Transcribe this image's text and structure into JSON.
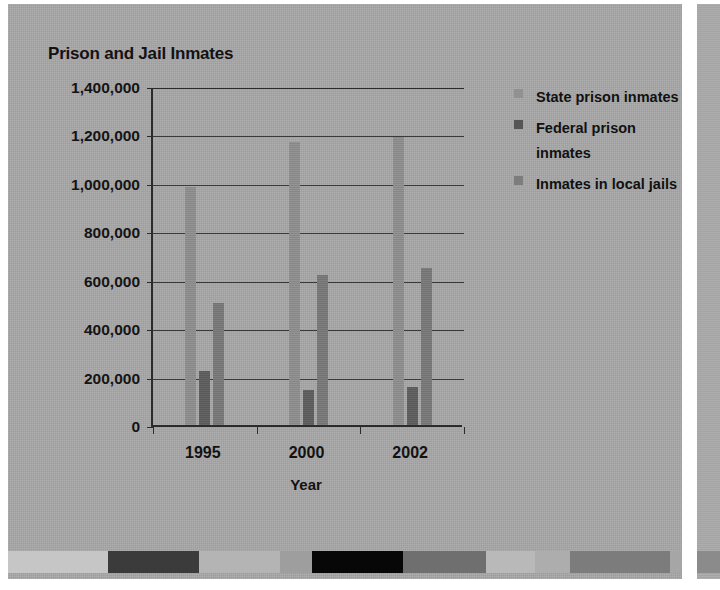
{
  "chart_data": {
    "type": "bar",
    "title": "Prison and Jail Inmates",
    "xlabel": "Year",
    "ylabel": "",
    "categories": [
      "1995",
      "2000",
      "2002"
    ],
    "series": [
      {
        "name": "State prison inmates",
        "key": "state",
        "color": "#8e8e8e",
        "values": [
          985000,
          1170000,
          1190000
        ]
      },
      {
        "name": "Federal prison inmates",
        "key": "federal",
        "color": "#5e5e5e",
        "values": [
          225000,
          145000,
          155000
        ]
      },
      {
        "name": "Inmates in local jails",
        "key": "local",
        "color": "#787878",
        "values": [
          505000,
          620000,
          650000
        ]
      }
    ],
    "ylim": [
      0,
      1400000
    ],
    "ytick_values": [
      0,
      200000,
      400000,
      600000,
      800000,
      1000000,
      1200000,
      1400000
    ],
    "ytick_labels": [
      "0",
      "200,000",
      "400,000",
      "600,000",
      "800,000",
      "1,000,000",
      "1,200,000",
      "1,400,000"
    ],
    "grid": true,
    "legend_position": "right"
  },
  "legend": {
    "items": [
      {
        "label": "State prison inmates",
        "swatch": "state"
      },
      {
        "label": "Federal prison inmates",
        "swatch": "federal"
      },
      {
        "label": "Inmates in local jails",
        "swatch": "local"
      }
    ]
  },
  "decor_strip": {
    "segments": [
      {
        "color": "#c6c6c6",
        "width": 17.4
      },
      {
        "color": "#3b3b3b",
        "width": 15.8
      },
      {
        "color": "#b4b4b4",
        "width": 14.0
      },
      {
        "color": "#9e9e9e",
        "width": 5.5
      },
      {
        "color": "#070707",
        "width": 15.9
      },
      {
        "color": "#6f6f6f",
        "width": 14.3
      },
      {
        "color": "#b9b9b9",
        "width": 8.6
      },
      {
        "color": "#adadad",
        "width": 6.0
      },
      {
        "color": "#7c7c7c",
        "width": 17.5
      },
      {
        "color": "#a6a6a6",
        "width": 2.0
      }
    ]
  },
  "colors": {
    "page_background": "#a8a8a8",
    "axis": "#2b2b2b",
    "text": "#121212",
    "gridline": "#3a3a3a"
  }
}
